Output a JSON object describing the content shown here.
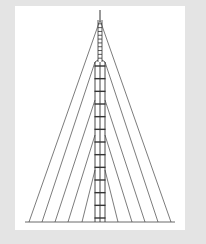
{
  "diagram": {
    "colors": {
      "background": "#e4e4e4",
      "panel": "#ffffff",
      "line": "#444444",
      "mast": "#333333"
    },
    "mast": {
      "x_center": 100,
      "tip_top": 10,
      "antenna_bottom": 20,
      "upper_section": {
        "top": 20,
        "bottom": 62,
        "half_width": 2,
        "rungs": 10
      },
      "lower_section": {
        "top": 62,
        "bottom": 222,
        "half_width": 5,
        "rungs": 12
      }
    },
    "ground_line": {
      "y": 222,
      "x1": 25,
      "x2": 175
    },
    "guy_levels": [
      {
        "attach_y": 20,
        "left_anchor_x": 29,
        "right_anchor_x": 171
      },
      {
        "attach_y": 62,
        "left_anchor_x": 42,
        "right_anchor_x": 158
      },
      {
        "attach_y": 100,
        "left_anchor_x": 55,
        "right_anchor_x": 145
      },
      {
        "attach_y": 135,
        "left_anchor_x": 68,
        "right_anchor_x": 132
      },
      {
        "attach_y": 170,
        "left_anchor_x": 82,
        "right_anchor_x": 118
      }
    ]
  }
}
